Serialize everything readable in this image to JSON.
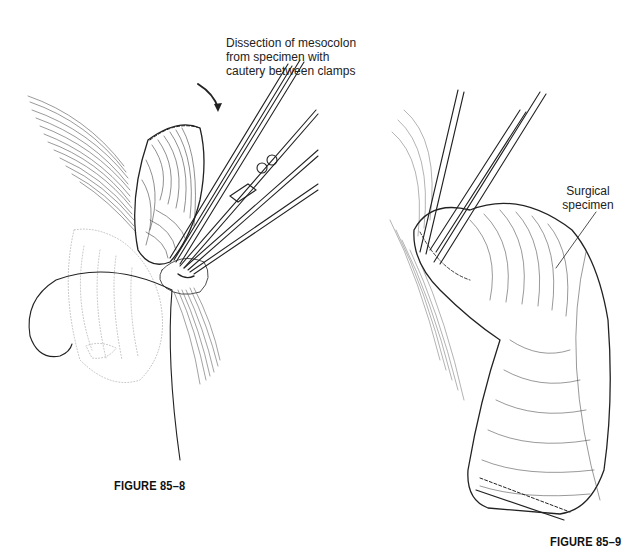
{
  "figures": [
    {
      "caption": "FIGURE 85–8",
      "annotation": {
        "line1": "Dissection of mesocolon",
        "line2": "from specimen with",
        "line3": "cautery between clamps"
      },
      "depicts": "clamps-on-mesocolon-with-suture"
    },
    {
      "caption": "FIGURE 85–9",
      "annotation": {
        "line1": "Surgical",
        "line2": "specimen"
      },
      "depicts": "resected-colon-segment-with-clamps"
    }
  ]
}
